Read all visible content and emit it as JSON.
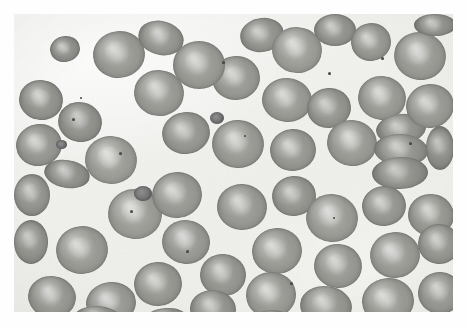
{
  "image": {
    "title": "Peripheral blood smear micrograph",
    "subject": "red-blood-cells",
    "specimen_label": "",
    "width": 467,
    "height": 329,
    "content_box": {
      "x": 14,
      "y": 14,
      "width": 439,
      "height": 298
    },
    "background_color": "#f3f3f0",
    "page_color": "#ffffff",
    "cell_color": "#9a9a95",
    "cell_rim_color": "#7e7e7a",
    "pallor_color": "#d8d8d4",
    "speck_color": "#3f3f42",
    "modality": "light-microscopy",
    "stain": "grayscale"
  },
  "cells": [
    {
      "x": 36,
      "y": 22,
      "w": 30,
      "h": 26,
      "rot": -12,
      "tone": 0.93,
      "pallor": 0.5
    },
    {
      "x": 5,
      "y": 66,
      "w": 44,
      "h": 40,
      "rot": 8,
      "tone": 0.95,
      "pallor": 0.75
    },
    {
      "x": 79,
      "y": 17,
      "w": 52,
      "h": 47,
      "rot": -6,
      "tone": 1.0,
      "pallor": 0.45
    },
    {
      "x": 124,
      "y": 7,
      "w": 46,
      "h": 34,
      "rot": 14,
      "tone": 0.97,
      "pallor": 0.4
    },
    {
      "x": 159,
      "y": 27,
      "w": 52,
      "h": 48,
      "rot": 0,
      "tone": 1.0,
      "pallor": 0.5
    },
    {
      "x": 226,
      "y": 4,
      "w": 44,
      "h": 34,
      "rot": -10,
      "tone": 0.96,
      "pallor": 0.35
    },
    {
      "x": 258,
      "y": 13,
      "w": 50,
      "h": 46,
      "rot": 6,
      "tone": 1.02,
      "pallor": 0.45
    },
    {
      "x": 300,
      "y": 0,
      "w": 42,
      "h": 32,
      "rot": 0,
      "tone": 0.95,
      "pallor": 0.3
    },
    {
      "x": 337,
      "y": 9,
      "w": 40,
      "h": 38,
      "rot": -8,
      "tone": 0.98,
      "pallor": 0.35
    },
    {
      "x": 380,
      "y": 18,
      "w": 52,
      "h": 48,
      "rot": 10,
      "tone": 1.0,
      "pallor": 0.55
    },
    {
      "x": 198,
      "y": 42,
      "w": 48,
      "h": 44,
      "rot": -4,
      "tone": 0.99,
      "pallor": 0.5
    },
    {
      "x": 120,
      "y": 56,
      "w": 50,
      "h": 46,
      "rot": 6,
      "tone": 1.0,
      "pallor": 0.45
    },
    {
      "x": 2,
      "y": 110,
      "w": 46,
      "h": 42,
      "rot": -10,
      "tone": 0.97,
      "pallor": 0.6
    },
    {
      "x": 44,
      "y": 88,
      "w": 44,
      "h": 40,
      "rot": 12,
      "tone": 0.94,
      "pallor": 0.4
    },
    {
      "x": 248,
      "y": 64,
      "w": 50,
      "h": 44,
      "rot": 4,
      "tone": 1.0,
      "pallor": 0.45
    },
    {
      "x": 293,
      "y": 74,
      "w": 44,
      "h": 40,
      "rot": -6,
      "tone": 0.96,
      "pallor": 0.35
    },
    {
      "x": 344,
      "y": 62,
      "w": 48,
      "h": 44,
      "rot": 8,
      "tone": 1.0,
      "pallor": 0.5
    },
    {
      "x": 392,
      "y": 70,
      "w": 48,
      "h": 44,
      "rot": -10,
      "tone": 0.99,
      "pallor": 0.45
    },
    {
      "x": 71,
      "y": 122,
      "w": 52,
      "h": 48,
      "rot": 6,
      "tone": 1.02,
      "pallor": 0.55
    },
    {
      "x": 148,
      "y": 98,
      "w": 48,
      "h": 42,
      "rot": -8,
      "tone": 0.97,
      "pallor": 0.4
    },
    {
      "x": 198,
      "y": 106,
      "w": 52,
      "h": 48,
      "rot": 4,
      "tone": 1.0,
      "pallor": 0.5
    },
    {
      "x": 256,
      "y": 115,
      "w": 46,
      "h": 42,
      "rot": -5,
      "tone": 0.98,
      "pallor": 0.45
    },
    {
      "x": 313,
      "y": 106,
      "w": 50,
      "h": 46,
      "rot": 9,
      "tone": 1.0,
      "pallor": 0.5
    },
    {
      "x": 362,
      "y": 100,
      "w": 50,
      "h": 30,
      "rot": -6,
      "tone": 0.95,
      "pallor": 0.3
    },
    {
      "x": 360,
      "y": 120,
      "w": 54,
      "h": 32,
      "rot": 3,
      "tone": 0.96,
      "pallor": 0.3
    },
    {
      "x": 358,
      "y": 143,
      "w": 56,
      "h": 32,
      "rot": -2,
      "tone": 0.94,
      "pallor": 0.28
    },
    {
      "x": 412,
      "y": 112,
      "w": 28,
      "h": 44,
      "rot": 0,
      "tone": 0.92,
      "pallor": 0.25
    },
    {
      "x": 0,
      "y": 160,
      "w": 36,
      "h": 42,
      "rot": 0,
      "tone": 0.95,
      "pallor": 0.4
    },
    {
      "x": 30,
      "y": 146,
      "w": 46,
      "h": 28,
      "rot": 10,
      "tone": 0.94,
      "pallor": 0.35
    },
    {
      "x": 94,
      "y": 175,
      "w": 54,
      "h": 50,
      "rot": 5,
      "tone": 1.02,
      "pallor": 0.55
    },
    {
      "x": 138,
      "y": 158,
      "w": 50,
      "h": 46,
      "rot": -8,
      "tone": 0.99,
      "pallor": 0.5
    },
    {
      "x": 203,
      "y": 170,
      "w": 50,
      "h": 46,
      "rot": 4,
      "tone": 0.99,
      "pallor": 0.45
    },
    {
      "x": 258,
      "y": 162,
      "w": 44,
      "h": 40,
      "rot": -6,
      "tone": 0.96,
      "pallor": 0.4
    },
    {
      "x": 292,
      "y": 180,
      "w": 52,
      "h": 48,
      "rot": 8,
      "tone": 1.01,
      "pallor": 0.5
    },
    {
      "x": 348,
      "y": 172,
      "w": 44,
      "h": 40,
      "rot": -4,
      "tone": 0.97,
      "pallor": 0.45
    },
    {
      "x": 394,
      "y": 180,
      "w": 46,
      "h": 42,
      "rot": 6,
      "tone": 0.98,
      "pallor": 0.45
    },
    {
      "x": 0,
      "y": 206,
      "w": 34,
      "h": 44,
      "rot": 0,
      "tone": 0.94,
      "pallor": 0.35
    },
    {
      "x": 42,
      "y": 212,
      "w": 52,
      "h": 48,
      "rot": -6,
      "tone": 1.0,
      "pallor": 0.5
    },
    {
      "x": 148,
      "y": 206,
      "w": 48,
      "h": 44,
      "rot": 7,
      "tone": 0.99,
      "pallor": 0.55
    },
    {
      "x": 120,
      "y": 248,
      "w": 48,
      "h": 44,
      "rot": -5,
      "tone": 0.98,
      "pallor": 0.5
    },
    {
      "x": 186,
      "y": 240,
      "w": 46,
      "h": 42,
      "rot": 5,
      "tone": 0.97,
      "pallor": 0.45
    },
    {
      "x": 238,
      "y": 214,
      "w": 50,
      "h": 46,
      "rot": -8,
      "tone": 1.0,
      "pallor": 0.5
    },
    {
      "x": 300,
      "y": 230,
      "w": 48,
      "h": 44,
      "rot": 4,
      "tone": 0.99,
      "pallor": 0.45
    },
    {
      "x": 356,
      "y": 218,
      "w": 50,
      "h": 46,
      "rot": -7,
      "tone": 1.0,
      "pallor": 0.5
    },
    {
      "x": 404,
      "y": 210,
      "w": 42,
      "h": 40,
      "rot": 6,
      "tone": 0.96,
      "pallor": 0.4
    },
    {
      "x": 14,
      "y": 262,
      "w": 48,
      "h": 42,
      "rot": 8,
      "tone": 0.98,
      "pallor": 0.45
    },
    {
      "x": 72,
      "y": 268,
      "w": 50,
      "h": 42,
      "rot": -6,
      "tone": 0.99,
      "pallor": 0.5
    },
    {
      "x": 176,
      "y": 276,
      "w": 46,
      "h": 38,
      "rot": 4,
      "tone": 0.96,
      "pallor": 0.4
    },
    {
      "x": 232,
      "y": 258,
      "w": 50,
      "h": 46,
      "rot": -4,
      "tone": 1.0,
      "pallor": 0.5
    },
    {
      "x": 286,
      "y": 272,
      "w": 52,
      "h": 40,
      "rot": 7,
      "tone": 0.98,
      "pallor": 0.45
    },
    {
      "x": 348,
      "y": 264,
      "w": 52,
      "h": 46,
      "rot": -6,
      "tone": 1.0,
      "pallor": 0.5
    },
    {
      "x": 404,
      "y": 258,
      "w": 44,
      "h": 42,
      "rot": 5,
      "tone": 0.97,
      "pallor": 0.45
    },
    {
      "x": 400,
      "y": 0,
      "w": 42,
      "h": 22,
      "rot": 0,
      "tone": 0.93,
      "pallor": 0.3
    },
    {
      "x": 60,
      "y": 292,
      "w": 48,
      "h": 26,
      "rot": 4,
      "tone": 0.95,
      "pallor": 0.35
    },
    {
      "x": 130,
      "y": 294,
      "w": 44,
      "h": 24,
      "rot": -4,
      "tone": 0.94,
      "pallor": 0.3
    },
    {
      "x": 238,
      "y": 296,
      "w": 40,
      "h": 22,
      "rot": 0,
      "tone": 0.93,
      "pallor": 0.3
    }
  ],
  "platelets": [
    {
      "x": 120,
      "y": 172,
      "w": 18,
      "h": 15,
      "rot": 0
    },
    {
      "x": 196,
      "y": 98,
      "w": 14,
      "h": 12,
      "rot": 0
    },
    {
      "x": 42,
      "y": 126,
      "w": 11,
      "h": 9,
      "rot": 0
    }
  ],
  "specks": [
    {
      "x": 58,
      "y": 104,
      "w": 3,
      "h": 3
    },
    {
      "x": 105,
      "y": 138,
      "w": 3,
      "h": 3
    },
    {
      "x": 208,
      "y": 47,
      "w": 3,
      "h": 3
    },
    {
      "x": 314,
      "y": 58,
      "w": 3,
      "h": 3
    },
    {
      "x": 367,
      "y": 43,
      "w": 3,
      "h": 3
    },
    {
      "x": 172,
      "y": 236,
      "w": 3,
      "h": 3
    },
    {
      "x": 116,
      "y": 196,
      "w": 3,
      "h": 3
    },
    {
      "x": 66,
      "y": 83,
      "w": 2,
      "h": 2
    },
    {
      "x": 276,
      "y": 268,
      "w": 3,
      "h": 3
    },
    {
      "x": 395,
      "y": 128,
      "w": 3,
      "h": 3
    },
    {
      "x": 230,
      "y": 121,
      "w": 2,
      "h": 2
    },
    {
      "x": 319,
      "y": 203,
      "w": 2,
      "h": 2
    }
  ]
}
